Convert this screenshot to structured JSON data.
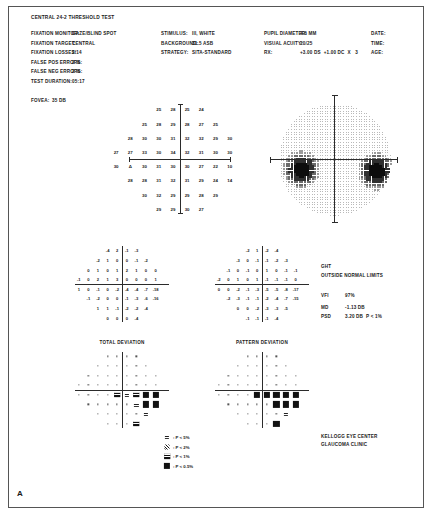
{
  "panel": {
    "label": "A"
  },
  "report": {
    "title": "CENTRAL 24-2 THRESHOLD TEST",
    "reliability": [
      {
        "label": "FIXATION MONITOR:",
        "value": "GAZE/BLIND SPOT"
      },
      {
        "label": "FIXATION TARGET:",
        "value": "CENTRAL"
      },
      {
        "label": "FIXATION LOSSES:",
        "value": "2/14"
      },
      {
        "label": "FALSE POS ERRORS:",
        "value": "2 %"
      },
      {
        "label": "FALSE NEG ERRORS:",
        "value": "2 %"
      },
      {
        "label": "TEST DURATION:",
        "value": "05:17"
      }
    ],
    "fovea": {
      "label": "FOVEA:",
      "value": "35 DB"
    },
    "stimulus": [
      {
        "label": "STIMULUS:",
        "value": "III, WHITE"
      },
      {
        "label": "BACKGROUND:",
        "value": "31.5 ASB"
      },
      {
        "label": "STRATEGY:",
        "value": "SITA-STANDARD"
      }
    ],
    "patient": [
      {
        "label": "PUPIL DIAMETER:",
        "value": "4.6 MM"
      },
      {
        "label": "VISUAL ACUITY:",
        "value": "20/25"
      },
      {
        "label": "RX:",
        "value": "+3.00 DS  +1.00 DC  X   3"
      }
    ],
    "meta": [
      {
        "label": "DATE:",
        "value": ""
      },
      {
        "label": "TIME:",
        "value": ""
      },
      {
        "label": "AGE:",
        "value": ""
      }
    ]
  },
  "indices": {
    "ght_label": "GHT",
    "ght_value": "OUTSIDE NORMAL LIMITS",
    "vfi_label": "VFI",
    "vfi_value": "97%",
    "md_label": "MD",
    "md_value": "-1.13 DB",
    "psd_label": "PSD",
    "psd_value": "3.20 DB  P < 1%"
  },
  "footer": {
    "line1": "KELLOGG EYE CENTER",
    "line2": "GLAUCOMA CLINIC"
  },
  "plot_titles": {
    "total": "TOTAL DEVIATION",
    "pattern": "PATTERN DEVIATION"
  },
  "legend": [
    {
      "symbol": "p5",
      "text": ": P < 5%"
    },
    {
      "symbol": "p2",
      "text": ": P < 2%"
    },
    {
      "symbol": "p1",
      "text": ": P < 1%"
    },
    {
      "symbol": "p05",
      "text": ": P < 0.5%"
    }
  ],
  "blind_spot_marker": "Δ",
  "chart_data": {
    "type": "scatter",
    "xlabel": "Horizontal eccentricity (degrees)",
    "ylabel": "Vertical eccentricity (degrees)",
    "xlim": [
      -27,
      27
    ],
    "ylim": [
      -27,
      27
    ],
    "grid": false,
    "units": "dB",
    "threshold_grid": {
      "description": "Measured retinal sensitivity in decibels at each of 54 test locations on a 6-degree grid.",
      "rows": [
        {
          "y": 21,
          "xs": [
            -9,
            -3,
            3,
            9
          ],
          "values": [
            25,
            28,
            25,
            24
          ]
        },
        {
          "y": 15,
          "xs": [
            -15,
            -9,
            -3,
            3,
            9,
            15
          ],
          "values": [
            25,
            28,
            29,
            28,
            27,
            25
          ]
        },
        {
          "y": 9,
          "xs": [
            -21,
            -15,
            -9,
            -3,
            3,
            9,
            15,
            21
          ],
          "values": [
            28,
            30,
            30,
            31,
            32,
            32,
            29,
            30
          ]
        },
        {
          "y": 3,
          "xs": [
            -27,
            -21,
            -15,
            -9,
            -3,
            3,
            9,
            15,
            21
          ],
          "values": [
            27,
            27,
            33,
            30,
            34,
            32,
            31,
            30,
            30
          ]
        },
        {
          "y": -3,
          "xs": [
            -27,
            -21,
            -15,
            -9,
            -3,
            3,
            9,
            15,
            21
          ],
          "values": [
            30,
            0,
            30,
            31,
            30,
            30,
            27,
            22,
            10
          ]
        },
        {
          "y": -9,
          "xs": [
            -21,
            -15,
            -9,
            -3,
            3,
            9,
            15,
            21
          ],
          "values": [
            28,
            28,
            31,
            32,
            31,
            29,
            24,
            14
          ]
        },
        {
          "y": -15,
          "xs": [
            -15,
            -9,
            -3,
            3,
            9,
            15
          ],
          "values": [
            30,
            32,
            29,
            29,
            28,
            29
          ]
        },
        {
          "y": -21,
          "xs": [
            -9,
            -3,
            3,
            9
          ],
          "values": [
            29,
            29,
            30,
            27
          ]
        }
      ],
      "blind_spot": {
        "x": -21,
        "y": -3,
        "marker": "Δ"
      }
    },
    "total_deviation": {
      "description": "Total deviation in dB: difference between measured sensitivity and age-matched normal.",
      "rows": [
        {
          "y": 21,
          "xs": [
            -9,
            -3,
            3,
            9
          ],
          "values": [
            -4,
            2,
            -1,
            -3
          ]
        },
        {
          "y": 15,
          "xs": [
            -15,
            -9,
            -3,
            3,
            9,
            15
          ],
          "values": [
            -2,
            1,
            0,
            0,
            -1,
            -2
          ]
        },
        {
          "y": 9,
          "xs": [
            -21,
            -15,
            -9,
            -3,
            3,
            9,
            15,
            21
          ],
          "values": [
            0,
            1,
            0,
            1,
            2,
            1,
            0,
            0
          ]
        },
        {
          "y": 3,
          "xs": [
            -27,
            -21,
            -15,
            -9,
            -3,
            3,
            9,
            15,
            21
          ],
          "values": [
            -1,
            0,
            2,
            1,
            3,
            0,
            0,
            0,
            1
          ]
        },
        {
          "y": -3,
          "xs": [
            -27,
            -21,
            -15,
            -9,
            -3,
            3,
            9,
            15,
            21
          ],
          "values": [
            1,
            0,
            -1,
            0,
            -2,
            -4,
            -4,
            -7,
            -18
          ]
        },
        {
          "y": -9,
          "xs": [
            -21,
            -15,
            -9,
            -3,
            3,
            9,
            15,
            21
          ],
          "values": [
            -1,
            -2,
            0,
            0,
            -1,
            -3,
            -6,
            -16
          ]
        },
        {
          "y": -15,
          "xs": [
            -15,
            -9,
            -3,
            3,
            9,
            15
          ],
          "values": [
            1,
            1,
            -1,
            -2,
            -2,
            -4
          ]
        },
        {
          "y": -21,
          "xs": [
            -9,
            -3,
            3,
            9
          ],
          "values": [
            0,
            0,
            0,
            -4
          ]
        }
      ]
    },
    "pattern_deviation": {
      "description": "Pattern deviation in dB: total deviation adjusted for overall height of the hill of vision.",
      "rows": [
        {
          "y": 21,
          "xs": [
            -9,
            -3,
            3,
            9
          ],
          "values": [
            -2,
            1,
            -2,
            -4
          ]
        },
        {
          "y": 15,
          "xs": [
            -15,
            -9,
            -3,
            3,
            9,
            15
          ],
          "values": [
            -3,
            0,
            -1,
            -1,
            -2,
            -3
          ]
        },
        {
          "y": 9,
          "xs": [
            -21,
            -15,
            -9,
            -3,
            3,
            9,
            15,
            21
          ],
          "values": [
            -1,
            0,
            -1,
            0,
            1,
            0,
            -1,
            -1
          ]
        },
        {
          "y": 3,
          "xs": [
            -27,
            -21,
            -15,
            -9,
            -3,
            3,
            9,
            15,
            21
          ],
          "values": [
            -2,
            0,
            1,
            0,
            1,
            -1,
            -1,
            -1,
            0
          ]
        },
        {
          "y": -3,
          "xs": [
            -27,
            -21,
            -15,
            -9,
            -3,
            3,
            9,
            15,
            21
          ],
          "values": [
            0,
            0,
            -2,
            -1,
            -3,
            -5,
            -5,
            -8,
            -17
          ]
        },
        {
          "y": -9,
          "xs": [
            -21,
            -15,
            -9,
            -3,
            3,
            9,
            15,
            21
          ],
          "values": [
            -2,
            -3,
            -1,
            -1,
            -2,
            -4,
            -7,
            -15
          ]
        },
        {
          "y": -15,
          "xs": [
            -15,
            -9,
            -3,
            3,
            9,
            15
          ],
          "values": [
            0,
            0,
            -2,
            -3,
            -3,
            -5
          ]
        },
        {
          "y": -21,
          "xs": [
            -9,
            -3,
            3,
            9
          ],
          "values": [
            -1,
            -1,
            -1,
            -4
          ]
        }
      ]
    },
    "total_deviation_probability": {
      "description": "Probability symbols for total deviation. Codes: n = within normal limits (dot), p5, p2, p1, p05.",
      "rows": [
        {
          "y": 21,
          "xs": [
            -9,
            -3,
            3,
            9
          ],
          "values": [
            "n",
            "n",
            "n",
            "n"
          ]
        },
        {
          "y": 15,
          "xs": [
            -15,
            -9,
            -3,
            3,
            9,
            15
          ],
          "values": [
            "n",
            "n",
            "n",
            "n",
            "n",
            "n"
          ]
        },
        {
          "y": 9,
          "xs": [
            -21,
            -15,
            -9,
            -3,
            3,
            9,
            15,
            21
          ],
          "values": [
            "n",
            "n",
            "n",
            "n",
            "n",
            "n",
            "n",
            "n"
          ]
        },
        {
          "y": 3,
          "xs": [
            -27,
            -21,
            -15,
            -9,
            -3,
            3,
            9,
            15,
            21
          ],
          "values": [
            "n",
            "n",
            "n",
            "n",
            "n",
            "n",
            "n",
            "n",
            "n"
          ]
        },
        {
          "y": -3,
          "xs": [
            -27,
            -21,
            -15,
            -9,
            -3,
            3,
            9,
            15,
            21
          ],
          "values": [
            "n",
            "n",
            "n",
            "n",
            "p1",
            "p5",
            "p1",
            "p05",
            "p05"
          ]
        },
        {
          "y": -9,
          "xs": [
            -21,
            -15,
            -9,
            -3,
            3,
            9,
            15,
            21
          ],
          "values": [
            "n",
            "n",
            "n",
            "n",
            "n",
            "p5",
            "p05",
            "p05"
          ]
        },
        {
          "y": -15,
          "xs": [
            -15,
            -9,
            -3,
            3,
            9,
            15
          ],
          "values": [
            "n",
            "n",
            "n",
            "n",
            "n",
            "p5"
          ]
        },
        {
          "y": -21,
          "xs": [
            -9,
            -3,
            3,
            9
          ],
          "values": [
            "n",
            "n",
            "n",
            "p1"
          ]
        }
      ]
    },
    "pattern_deviation_probability": {
      "description": "Probability symbols for pattern deviation. Codes: n = within normal limits (dot), p5, p2, p1, p05.",
      "rows": [
        {
          "y": 21,
          "xs": [
            -9,
            -3,
            3,
            9
          ],
          "values": [
            "n",
            "n",
            "n",
            "n"
          ]
        },
        {
          "y": 15,
          "xs": [
            -15,
            -9,
            -3,
            3,
            9,
            15
          ],
          "values": [
            "n",
            "n",
            "n",
            "n",
            "n",
            "n"
          ]
        },
        {
          "y": 9,
          "xs": [
            -21,
            -15,
            -9,
            -3,
            3,
            9,
            15,
            21
          ],
          "values": [
            "n",
            "n",
            "n",
            "n",
            "n",
            "n",
            "n",
            "n"
          ]
        },
        {
          "y": 3,
          "xs": [
            -27,
            -21,
            -15,
            -9,
            -3,
            3,
            9,
            15,
            21
          ],
          "values": [
            "n",
            "n",
            "n",
            "n",
            "n",
            "n",
            "n",
            "n",
            "n"
          ]
        },
        {
          "y": -3,
          "xs": [
            -27,
            -21,
            -15,
            -9,
            -3,
            3,
            9,
            15,
            21
          ],
          "values": [
            "n",
            "n",
            "n",
            "n",
            "p05",
            "p05",
            "p05",
            "p05",
            "p05"
          ]
        },
        {
          "y": -9,
          "xs": [
            -21,
            -15,
            -9,
            -3,
            3,
            9,
            15,
            21
          ],
          "values": [
            "n",
            "n",
            "n",
            "n",
            "n",
            "p05",
            "p05",
            "p05"
          ]
        },
        {
          "y": -15,
          "xs": [
            -15,
            -9,
            -3,
            3,
            9,
            15
          ],
          "values": [
            "n",
            "n",
            "n",
            "n",
            "n",
            "p5"
          ]
        },
        {
          "y": -21,
          "xs": [
            -9,
            -3,
            3,
            9
          ],
          "values": [
            "n",
            "n",
            "n",
            "p05"
          ]
        }
      ]
    },
    "grayscale": {
      "description": "Grayscale sensitivity map. Darker regions denote depressed sensitivity; two dense scotomas are present just below the horizontal meridian on the nasal and temporal sides.",
      "dark_regions": [
        {
          "cx": -18,
          "cy": -5,
          "radius": 6,
          "label": "blind spot / nasal defect"
        },
        {
          "cx": 22,
          "cy": -6,
          "radius": 6,
          "label": "temporal arcuate defect"
        }
      ]
    }
  }
}
